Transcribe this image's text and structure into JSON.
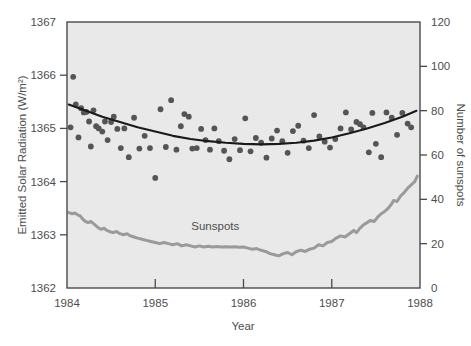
{
  "figure": {
    "background_color": "#ffffff",
    "plot_background_color": "#e9e9e9",
    "plot_border_color": "#4a4a4a"
  },
  "chart_data": {
    "type": "scatter",
    "title": "",
    "xlabel": "Year",
    "ylabel": "Emitted Solar Radiation (W/m²)",
    "y2label": "Number of sunspots",
    "xlim": [
      1984,
      1988
    ],
    "ylim": [
      1362,
      1367
    ],
    "y2lim": [
      0,
      120
    ],
    "xticks": [
      1984,
      1985,
      1986,
      1987,
      1988
    ],
    "xtick_labels": [
      "1984",
      "1985",
      "1986",
      "1987",
      "1988"
    ],
    "yticks": [
      1362,
      1363,
      1364,
      1365,
      1366,
      1367
    ],
    "ytick_labels": [
      "1362",
      "1363",
      "1364",
      "1365",
      "1366",
      "1367"
    ],
    "y2ticks": [
      0,
      20,
      40,
      60,
      80,
      100,
      120
    ],
    "y2tick_labels": [
      "0",
      "20",
      "40",
      "60",
      "80",
      "100",
      "120"
    ],
    "grid": false,
    "legend_position": "inline-annotation",
    "annotations": [
      {
        "text": "Sunspots",
        "x": 1985.68,
        "y_axis": "right",
        "y": 26
      }
    ],
    "series": [
      {
        "name": "Emitted Solar Radiation",
        "type": "scatter",
        "axis": "left",
        "marker": "circle",
        "marker_color": "#555555",
        "marker_size": 4.2,
        "points": [
          [
            1984.04,
            1365.02
          ],
          [
            1984.07,
            1365.97
          ],
          [
            1984.1,
            1365.45
          ],
          [
            1984.13,
            1364.83
          ],
          [
            1984.16,
            1365.38
          ],
          [
            1984.19,
            1365.3
          ],
          [
            1984.22,
            1365.31
          ],
          [
            1984.25,
            1365.13
          ],
          [
            1984.27,
            1364.66
          ],
          [
            1984.3,
            1365.34
          ],
          [
            1984.33,
            1365.04
          ],
          [
            1984.36,
            1365.0
          ],
          [
            1984.4,
            1364.94
          ],
          [
            1984.43,
            1365.13
          ],
          [
            1984.46,
            1364.78
          ],
          [
            1984.5,
            1365.12
          ],
          [
            1984.53,
            1365.22
          ],
          [
            1984.57,
            1364.99
          ],
          [
            1984.61,
            1364.63
          ],
          [
            1984.65,
            1365.0
          ],
          [
            1984.7,
            1364.46
          ],
          [
            1984.76,
            1365.2
          ],
          [
            1984.82,
            1364.62
          ],
          [
            1984.88,
            1364.86
          ],
          [
            1984.94,
            1364.63
          ],
          [
            1985.0,
            1364.07
          ],
          [
            1985.06,
            1365.36
          ],
          [
            1985.12,
            1364.65
          ],
          [
            1985.18,
            1365.53
          ],
          [
            1985.24,
            1364.6
          ],
          [
            1985.29,
            1365.04
          ],
          [
            1985.33,
            1365.27
          ],
          [
            1985.38,
            1365.22
          ],
          [
            1985.42,
            1364.62
          ],
          [
            1985.47,
            1364.63
          ],
          [
            1985.52,
            1364.99
          ],
          [
            1985.57,
            1364.78
          ],
          [
            1985.62,
            1364.6
          ],
          [
            1985.67,
            1365.0
          ],
          [
            1985.72,
            1364.76
          ],
          [
            1985.78,
            1364.58
          ],
          [
            1985.84,
            1364.42
          ],
          [
            1985.9,
            1364.8
          ],
          [
            1985.96,
            1364.59
          ],
          [
            1986.02,
            1365.19
          ],
          [
            1986.08,
            1364.57
          ],
          [
            1986.14,
            1364.82
          ],
          [
            1986.2,
            1364.73
          ],
          [
            1986.26,
            1364.45
          ],
          [
            1986.32,
            1364.81
          ],
          [
            1986.38,
            1364.96
          ],
          [
            1986.44,
            1364.76
          ],
          [
            1986.5,
            1364.54
          ],
          [
            1986.56,
            1364.95
          ],
          [
            1986.62,
            1365.05
          ],
          [
            1986.68,
            1364.77
          ],
          [
            1986.74,
            1364.63
          ],
          [
            1986.8,
            1365.25
          ],
          [
            1986.86,
            1364.85
          ],
          [
            1986.92,
            1364.75
          ],
          [
            1986.98,
            1364.64
          ],
          [
            1987.04,
            1364.8
          ],
          [
            1987.1,
            1365.0
          ],
          [
            1987.16,
            1365.3
          ],
          [
            1987.22,
            1364.98
          ],
          [
            1987.28,
            1365.12
          ],
          [
            1987.32,
            1365.08
          ],
          [
            1987.36,
            1365.02
          ],
          [
            1987.42,
            1364.55
          ],
          [
            1987.46,
            1365.29
          ],
          [
            1987.5,
            1364.71
          ],
          [
            1987.56,
            1364.46
          ],
          [
            1987.62,
            1365.3
          ],
          [
            1987.68,
            1365.2
          ],
          [
            1987.74,
            1364.88
          ],
          [
            1987.8,
            1365.29
          ],
          [
            1987.86,
            1365.09
          ],
          [
            1987.9,
            1365.02
          ]
        ]
      },
      {
        "name": "Emitted Solar Radiation trend",
        "type": "line",
        "axis": "left",
        "line_color": "#1a1a1a",
        "line_width": 2.1,
        "points": [
          [
            1984.02,
            1365.45
          ],
          [
            1984.2,
            1365.34
          ],
          [
            1984.4,
            1365.22
          ],
          [
            1984.6,
            1365.12
          ],
          [
            1984.8,
            1365.02
          ],
          [
            1985.0,
            1364.94
          ],
          [
            1985.2,
            1364.86
          ],
          [
            1985.4,
            1364.8
          ],
          [
            1985.6,
            1364.76
          ],
          [
            1985.8,
            1364.73
          ],
          [
            1986.0,
            1364.71
          ],
          [
            1986.2,
            1364.7
          ],
          [
            1986.4,
            1364.71
          ],
          [
            1986.6,
            1364.73
          ],
          [
            1986.8,
            1364.77
          ],
          [
            1987.0,
            1364.83
          ],
          [
            1987.2,
            1364.91
          ],
          [
            1987.4,
            1365.0
          ],
          [
            1987.6,
            1365.1
          ],
          [
            1987.8,
            1365.22
          ],
          [
            1987.96,
            1365.33
          ]
        ]
      },
      {
        "name": "Sunspots",
        "type": "line",
        "axis": "right",
        "line_color": "#9a9a9a",
        "line_width": 3.0,
        "points": [
          [
            1984.02,
            34.0
          ],
          [
            1984.06,
            33.5
          ],
          [
            1984.09,
            33.8
          ],
          [
            1984.12,
            33.0
          ],
          [
            1984.15,
            32.5
          ],
          [
            1984.18,
            31.0
          ],
          [
            1984.21,
            30.0
          ],
          [
            1984.24,
            29.5
          ],
          [
            1984.27,
            30.0
          ],
          [
            1984.3,
            29.0
          ],
          [
            1984.33,
            28.0
          ],
          [
            1984.36,
            27.0
          ],
          [
            1984.39,
            26.5
          ],
          [
            1984.42,
            27.0
          ],
          [
            1984.45,
            26.0
          ],
          [
            1984.48,
            25.5
          ],
          [
            1984.52,
            25.0
          ],
          [
            1984.56,
            25.5
          ],
          [
            1984.6,
            24.5
          ],
          [
            1984.64,
            24.0
          ],
          [
            1984.68,
            24.5
          ],
          [
            1984.72,
            23.5
          ],
          [
            1984.76,
            23.0
          ],
          [
            1984.8,
            22.5
          ],
          [
            1984.85,
            22.0
          ],
          [
            1984.9,
            21.5
          ],
          [
            1984.95,
            21.0
          ],
          [
            1985.0,
            20.5
          ],
          [
            1985.05,
            20.0
          ],
          [
            1985.1,
            20.5
          ],
          [
            1985.15,
            20.0
          ],
          [
            1985.2,
            19.5
          ],
          [
            1985.25,
            20.0
          ],
          [
            1985.3,
            19.0
          ],
          [
            1985.35,
            19.5
          ],
          [
            1985.4,
            19.0
          ],
          [
            1985.45,
            18.5
          ],
          [
            1985.5,
            19.0
          ],
          [
            1985.55,
            18.5
          ],
          [
            1985.6,
            18.8
          ],
          [
            1985.65,
            18.5
          ],
          [
            1985.7,
            18.7
          ],
          [
            1985.75,
            18.5
          ],
          [
            1985.8,
            18.6
          ],
          [
            1985.85,
            18.5
          ],
          [
            1985.9,
            18.6
          ],
          [
            1985.95,
            18.4
          ],
          [
            1986.0,
            18.5
          ],
          [
            1986.05,
            18.0
          ],
          [
            1986.1,
            17.5
          ],
          [
            1986.15,
            17.8
          ],
          [
            1986.2,
            17.0
          ],
          [
            1986.25,
            16.5
          ],
          [
            1986.3,
            15.5
          ],
          [
            1986.35,
            15.0
          ],
          [
            1986.4,
            14.5
          ],
          [
            1986.45,
            15.5
          ],
          [
            1986.5,
            16.0
          ],
          [
            1986.55,
            15.0
          ],
          [
            1986.6,
            16.5
          ],
          [
            1986.65,
            17.0
          ],
          [
            1986.7,
            16.5
          ],
          [
            1986.75,
            17.5
          ],
          [
            1986.8,
            18.0
          ],
          [
            1986.85,
            19.5
          ],
          [
            1986.9,
            19.0
          ],
          [
            1986.95,
            20.5
          ],
          [
            1987.0,
            21.0
          ],
          [
            1987.05,
            22.5
          ],
          [
            1987.1,
            23.5
          ],
          [
            1987.15,
            23.0
          ],
          [
            1987.2,
            24.5
          ],
          [
            1987.25,
            26.0
          ],
          [
            1987.28,
            25.0
          ],
          [
            1987.32,
            27.0
          ],
          [
            1987.36,
            28.5
          ],
          [
            1987.4,
            29.5
          ],
          [
            1987.44,
            30.5
          ],
          [
            1987.48,
            30.0
          ],
          [
            1987.52,
            32.0
          ],
          [
            1987.56,
            33.5
          ],
          [
            1987.6,
            34.5
          ],
          [
            1987.64,
            36.0
          ],
          [
            1987.68,
            38.0
          ],
          [
            1987.7,
            39.5
          ],
          [
            1987.74,
            39.0
          ],
          [
            1987.78,
            41.5
          ],
          [
            1987.82,
            43.0
          ],
          [
            1987.86,
            45.0
          ],
          [
            1987.9,
            46.5
          ],
          [
            1987.94,
            48.0
          ],
          [
            1987.97,
            50.5
          ]
        ]
      }
    ]
  }
}
